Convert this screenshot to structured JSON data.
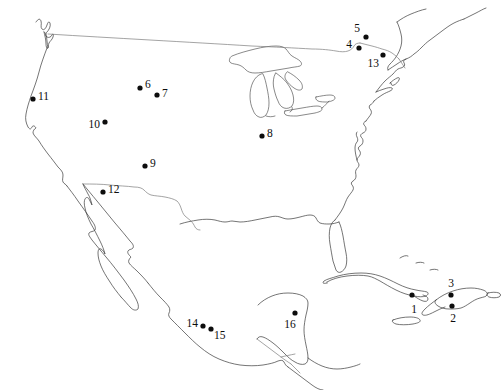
{
  "figure": {
    "kind": "map",
    "title": "",
    "region": "North America, Mexico and the Caribbean",
    "background_color": "#ffffff",
    "width": 504,
    "height": 390
  },
  "style": {
    "coastline_color": "#3a3a3a",
    "border_color": "#7d7d7d",
    "lake_color": "#4a4a4a",
    "marker_color": "#0d0d0d",
    "label_color": "#0d0d0d"
  },
  "sites": [
    {
      "id": "1",
      "label": "1",
      "x": 412,
      "y": 295,
      "label_x": 414,
      "label_y": 310,
      "anchor": "mid"
    },
    {
      "id": "2",
      "label": "2",
      "x": 452,
      "y": 306,
      "label_x": 453,
      "label_y": 319,
      "anchor": "mid"
    },
    {
      "id": "3",
      "label": "3",
      "x": 451,
      "y": 295,
      "label_x": 451,
      "label_y": 284,
      "anchor": "mid"
    },
    {
      "id": "4",
      "label": "4",
      "x": 359,
      "y": 48,
      "label_x": 352,
      "label_y": 45,
      "anchor": "end"
    },
    {
      "id": "5",
      "label": "5",
      "x": 366,
      "y": 37,
      "label_x": 360,
      "label_y": 29,
      "anchor": "end"
    },
    {
      "id": "6",
      "label": "6",
      "x": 140,
      "y": 88,
      "label_x": 145,
      "label_y": 85,
      "anchor": "start"
    },
    {
      "id": "7",
      "label": "7",
      "x": 157,
      "y": 95,
      "label_x": 162,
      "label_y": 94,
      "anchor": "start"
    },
    {
      "id": "8",
      "label": "8",
      "x": 262,
      "y": 136,
      "label_x": 267,
      "label_y": 134,
      "anchor": "start"
    },
    {
      "id": "9",
      "label": "9",
      "x": 145,
      "y": 166,
      "label_x": 150,
      "label_y": 164,
      "anchor": "start"
    },
    {
      "id": "10",
      "label": "10",
      "x": 105,
      "y": 122,
      "label_x": 100,
      "label_y": 125,
      "anchor": "end"
    },
    {
      "id": "11",
      "label": "11",
      "x": 33,
      "y": 99,
      "label_x": 38,
      "label_y": 97,
      "anchor": "start"
    },
    {
      "id": "12",
      "label": "12",
      "x": 103,
      "y": 192,
      "label_x": 108,
      "label_y": 190,
      "anchor": "start"
    },
    {
      "id": "13",
      "label": "13",
      "x": 383,
      "y": 55,
      "label_x": 379,
      "label_y": 64,
      "anchor": "end"
    },
    {
      "id": "14",
      "label": "14",
      "x": 203,
      "y": 326,
      "label_x": 198,
      "label_y": 324,
      "anchor": "end"
    },
    {
      "id": "15",
      "label": "15",
      "x": 211,
      "y": 329,
      "label_x": 214,
      "label_y": 336,
      "anchor": "start"
    },
    {
      "id": "16",
      "label": "16",
      "x": 295,
      "y": 313,
      "label_x": 290,
      "label_y": 325,
      "anchor": "mid"
    }
  ]
}
